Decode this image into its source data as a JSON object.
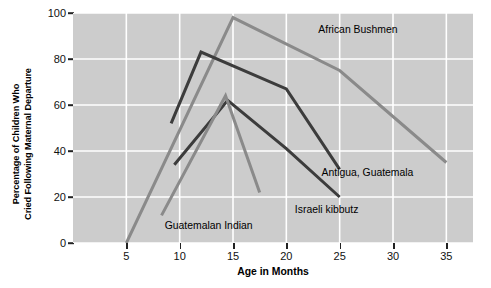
{
  "chart_data": {
    "type": "line",
    "title": "",
    "xlabel": "Age in Months",
    "ylabel": "Percentage of Children Who Cried Following Maternal Departure",
    "ylabel_line1": "Percentage of Children Who",
    "ylabel_line2": "Cried Following Maternal Departure",
    "xlim": [
      0,
      37.5
    ],
    "ylim": [
      0,
      100
    ],
    "xticks": [
      5,
      10,
      15,
      20,
      25,
      30,
      35
    ],
    "yticks": [
      0,
      20,
      40,
      60,
      80,
      100
    ],
    "grid": true,
    "grid_color": "#ffffff",
    "panel_color": "#cccccc",
    "legend": "inline-annotations",
    "series": [
      {
        "name": "African Bushmen",
        "color": "#8a8a8a",
        "label_x": 23.0,
        "label_y": 92,
        "points": [
          [
            5,
            0
          ],
          [
            15,
            98
          ],
          [
            25,
            75
          ],
          [
            35,
            35
          ]
        ]
      },
      {
        "name": "Antigua, Guatemala",
        "color": "#3c3c3c",
        "label_x": 23.3,
        "label_y": 30,
        "points": [
          [
            9.2,
            52
          ],
          [
            12,
            83
          ],
          [
            20,
            67
          ],
          [
            25,
            32
          ]
        ]
      },
      {
        "name": "Israeli kibbutz",
        "color": "#3c3c3c",
        "label_x": 20.8,
        "label_y": 14,
        "points": [
          [
            9.5,
            34
          ],
          [
            14.5,
            62
          ],
          [
            20,
            41
          ],
          [
            25,
            20
          ]
        ]
      },
      {
        "name": "Guatemalan Indian",
        "color": "#8a8a8a",
        "label_x": 8.6,
        "label_y": 7,
        "points": [
          [
            8.3,
            12
          ],
          [
            14.3,
            64
          ],
          [
            17.5,
            22
          ]
        ]
      }
    ]
  }
}
